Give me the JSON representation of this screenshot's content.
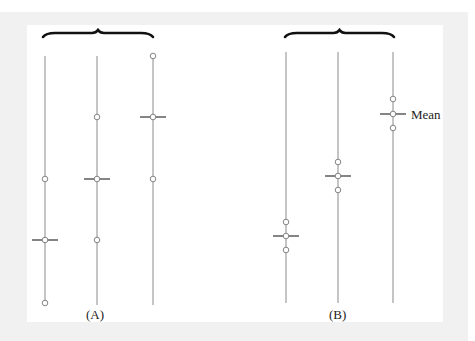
{
  "figure": {
    "panels": [
      {
        "label": "(A)",
        "label_pos": {
          "x": 97,
          "y": 315
        },
        "brace": {
          "x1": 43,
          "x2": 153,
          "y": 33
        },
        "groups": [
          {
            "x": 45,
            "line_top": 56,
            "line_bottom": 305,
            "points_y": [
              179,
              240,
              303
            ],
            "mean_y": 240
          },
          {
            "x": 97,
            "line_top": 56,
            "line_bottom": 305,
            "points_y": [
              117,
              179,
              240
            ],
            "mean_y": 179
          },
          {
            "x": 153,
            "line_top": 56,
            "line_bottom": 305,
            "points_y": [
              56,
              117,
              179
            ],
            "mean_y": 117
          }
        ]
      },
      {
        "label": "(B)",
        "label_pos": {
          "x": 340,
          "y": 315
        },
        "brace": {
          "x1": 285,
          "x2": 394,
          "y": 33
        },
        "groups": [
          {
            "x": 286,
            "line_top": 52,
            "line_bottom": 303,
            "points_y": [
              222,
              236,
              250
            ],
            "mean_y": 236
          },
          {
            "x": 338,
            "line_top": 52,
            "line_bottom": 303,
            "points_y": [
              162,
              176,
              190
            ],
            "mean_y": 176
          },
          {
            "x": 393,
            "line_top": 52,
            "line_bottom": 303,
            "points_y": [
              99,
              114,
              128
            ],
            "mean_y": 114
          }
        ]
      }
    ],
    "mean_annotation": {
      "text": "Mean",
      "x": 411,
      "y": 107
    },
    "colors": {
      "line": "#8a8a8a",
      "mean_tick": "#333333",
      "brace": "#111111",
      "circle_stroke": "#777777",
      "frame": "#f1f1f1"
    }
  }
}
